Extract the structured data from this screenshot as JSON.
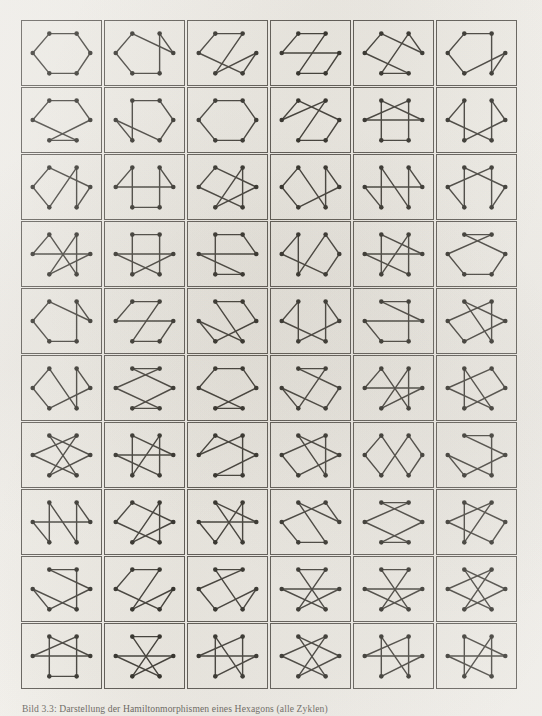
{
  "figure": {
    "caption": "Bild 3.3: Darstellung der Hamiltonmorphismen eines Hexagons (alle Zyklen)",
    "rows": 10,
    "columns": 6,
    "cell_count": 60,
    "vertices_per_cell": 6,
    "edges_per_cell": 6,
    "colors": {
      "page_background": "#f2f0eb",
      "cell_background": "#efede7",
      "cell_border": "#4a4742",
      "edge": "#2a2823",
      "vertex": "#181712"
    }
  },
  "chart_data": {
    "type": "diagram-grid",
    "title": "Bild 3.3: Darstellung der Hamiltonmorphismen eines Hexagons (alle Zyklen)",
    "node_layout": "hexagon",
    "node_positions": [
      {
        "id": 0,
        "label": "top-left",
        "x": 28,
        "y": 13
      },
      {
        "id": 1,
        "label": "top-right",
        "x": 56,
        "y": 13
      },
      {
        "id": 2,
        "label": "middle-right",
        "x": 70,
        "y": 33
      },
      {
        "id": 3,
        "label": "bottom-right",
        "x": 56,
        "y": 54
      },
      {
        "id": 4,
        "label": "bottom-left",
        "x": 28,
        "y": 54
      },
      {
        "id": 5,
        "label": "middle-left",
        "x": 11,
        "y": 33
      }
    ],
    "cells": [
      {
        "index": 1,
        "row": 1,
        "col": 1,
        "cycle": [
          0,
          1,
          2,
          3,
          4,
          5
        ]
      },
      {
        "index": 2,
        "row": 1,
        "col": 2,
        "cycle": [
          0,
          2,
          1,
          3,
          4,
          5
        ]
      },
      {
        "index": 3,
        "row": 1,
        "col": 3,
        "cycle": [
          0,
          1,
          4,
          2,
          3,
          5
        ]
      },
      {
        "index": 4,
        "row": 1,
        "col": 4,
        "cycle": [
          0,
          1,
          4,
          3,
          2,
          5
        ]
      },
      {
        "index": 5,
        "row": 1,
        "col": 5,
        "cycle": [
          0,
          2,
          1,
          4,
          3,
          5
        ]
      },
      {
        "index": 6,
        "row": 1,
        "col": 6,
        "cycle": [
          0,
          1,
          3,
          2,
          4,
          5
        ]
      },
      {
        "index": 7,
        "row": 2,
        "col": 1,
        "cycle": [
          0,
          1,
          2,
          4,
          3,
          5
        ]
      },
      {
        "index": 8,
        "row": 2,
        "col": 2,
        "cycle": [
          0,
          1,
          2,
          3,
          5,
          4
        ]
      },
      {
        "index": 9,
        "row": 2,
        "col": 3,
        "cycle": [
          0,
          1,
          2,
          3,
          4,
          5
        ]
      },
      {
        "index": 10,
        "row": 2,
        "col": 4,
        "cycle": [
          0,
          2,
          3,
          4,
          1,
          5
        ]
      },
      {
        "index": 11,
        "row": 2,
        "col": 5,
        "cycle": [
          0,
          2,
          5,
          1,
          3,
          4
        ]
      },
      {
        "index": 12,
        "row": 2,
        "col": 6,
        "cycle": [
          0,
          4,
          2,
          1,
          3,
          5
        ]
      },
      {
        "index": 13,
        "row": 3,
        "col": 1,
        "cycle": [
          0,
          5,
          4,
          1,
          3,
          2
        ]
      },
      {
        "index": 14,
        "row": 3,
        "col": 2,
        "cycle": [
          0,
          5,
          2,
          1,
          3,
          4
        ]
      },
      {
        "index": 15,
        "row": 3,
        "col": 3,
        "cycle": [
          0,
          2,
          4,
          1,
          3,
          5
        ]
      },
      {
        "index": 16,
        "row": 3,
        "col": 4,
        "cycle": [
          0,
          3,
          1,
          2,
          4,
          5
        ]
      },
      {
        "index": 17,
        "row": 3,
        "col": 5,
        "cycle": [
          0,
          4,
          5,
          2,
          1,
          3
        ]
      },
      {
        "index": 18,
        "row": 3,
        "col": 6,
        "cycle": [
          0,
          2,
          3,
          1,
          5,
          4
        ]
      },
      {
        "index": 19,
        "row": 4,
        "col": 1,
        "cycle": [
          0,
          3,
          1,
          4,
          2,
          5
        ]
      },
      {
        "index": 20,
        "row": 4,
        "col": 2,
        "cycle": [
          0,
          1,
          3,
          5,
          2,
          4
        ]
      },
      {
        "index": 21,
        "row": 4,
        "col": 3,
        "cycle": [
          0,
          1,
          2,
          5,
          3,
          4
        ]
      },
      {
        "index": 22,
        "row": 4,
        "col": 4,
        "cycle": [
          0,
          4,
          1,
          2,
          3,
          5
        ]
      },
      {
        "index": 23,
        "row": 4,
        "col": 5,
        "cycle": [
          0,
          2,
          5,
          3,
          1,
          4
        ]
      },
      {
        "index": 24,
        "row": 4,
        "col": 6,
        "cycle": [
          0,
          2,
          3,
          4,
          5,
          1
        ]
      },
      {
        "index": 25,
        "row": 5,
        "col": 1,
        "cycle": [
          0,
          5,
          4,
          3,
          1,
          2
        ]
      },
      {
        "index": 26,
        "row": 5,
        "col": 2,
        "cycle": [
          0,
          5,
          2,
          3,
          4,
          1
        ]
      },
      {
        "index": 27,
        "row": 5,
        "col": 3,
        "cycle": [
          0,
          1,
          2,
          4,
          5,
          3
        ]
      },
      {
        "index": 28,
        "row": 5,
        "col": 4,
        "cycle": [
          0,
          5,
          3,
          1,
          2,
          4
        ]
      },
      {
        "index": 29,
        "row": 5,
        "col": 5,
        "cycle": [
          0,
          2,
          5,
          4,
          3,
          1
        ]
      },
      {
        "index": 30,
        "row": 5,
        "col": 6,
        "cycle": [
          0,
          3,
          1,
          5,
          4,
          2
        ]
      },
      {
        "index": 31,
        "row": 6,
        "col": 1,
        "cycle": [
          0,
          5,
          4,
          2,
          1,
          3
        ]
      },
      {
        "index": 32,
        "row": 6,
        "col": 2,
        "cycle": [
          0,
          1,
          5,
          3,
          4,
          2
        ]
      },
      {
        "index": 33,
        "row": 6,
        "col": 3,
        "cycle": [
          0,
          5,
          3,
          4,
          2,
          1
        ]
      },
      {
        "index": 34,
        "row": 6,
        "col": 4,
        "cycle": [
          0,
          1,
          4,
          5,
          3,
          2
        ]
      },
      {
        "index": 35,
        "row": 6,
        "col": 5,
        "cycle": [
          0,
          5,
          2,
          4,
          1,
          3
        ]
      },
      {
        "index": 36,
        "row": 6,
        "col": 6,
        "cycle": [
          0,
          3,
          5,
          1,
          2,
          4
        ]
      },
      {
        "index": 37,
        "row": 7,
        "col": 1,
        "cycle": [
          0,
          2,
          4,
          1,
          5,
          3
        ]
      },
      {
        "index": 38,
        "row": 7,
        "col": 2,
        "cycle": [
          0,
          4,
          1,
          3,
          5,
          2
        ]
      },
      {
        "index": 39,
        "row": 7,
        "col": 3,
        "cycle": [
          0,
          2,
          4,
          3,
          1,
          5
        ]
      },
      {
        "index": 40,
        "row": 7,
        "col": 4,
        "cycle": [
          0,
          2,
          4,
          5,
          1,
          3
        ]
      },
      {
        "index": 41,
        "row": 7,
        "col": 5,
        "cycle": [
          0,
          3,
          2,
          1,
          4,
          5
        ]
      },
      {
        "index": 42,
        "row": 7,
        "col": 6,
        "cycle": [
          0,
          1,
          3,
          5,
          4,
          2
        ]
      },
      {
        "index": 43,
        "row": 8,
        "col": 1,
        "cycle": [
          0,
          3,
          1,
          2,
          5,
          4
        ]
      },
      {
        "index": 44,
        "row": 8,
        "col": 2,
        "cycle": [
          0,
          2,
          4,
          1,
          3,
          5
        ]
      },
      {
        "index": 45,
        "row": 8,
        "col": 3,
        "cycle": [
          0,
          2,
          5,
          4,
          1,
          3
        ]
      },
      {
        "index": 46,
        "row": 8,
        "col": 4,
        "cycle": [
          0,
          2,
          1,
          5,
          4,
          3
        ]
      },
      {
        "index": 47,
        "row": 8,
        "col": 5,
        "cycle": [
          0,
          2,
          4,
          3,
          5,
          1
        ]
      },
      {
        "index": 48,
        "row": 8,
        "col": 6,
        "cycle": [
          0,
          2,
          3,
          5,
          1,
          4
        ]
      },
      {
        "index": 49,
        "row": 9,
        "col": 1,
        "cycle": [
          0,
          2,
          4,
          5,
          3,
          1
        ]
      },
      {
        "index": 50,
        "row": 9,
        "col": 2,
        "cycle": [
          0,
          5,
          3,
          2,
          4,
          1
        ]
      },
      {
        "index": 51,
        "row": 9,
        "col": 3,
        "cycle": [
          0,
          1,
          5,
          4,
          2,
          3
        ]
      },
      {
        "index": 52,
        "row": 9,
        "col": 4,
        "cycle": [
          0,
          1,
          4,
          2,
          5,
          3
        ]
      },
      {
        "index": 53,
        "row": 9,
        "col": 5,
        "cycle": [
          0,
          3,
          5,
          2,
          4,
          1
        ]
      },
      {
        "index": 54,
        "row": 9,
        "col": 6,
        "cycle": [
          0,
          2,
          4,
          1,
          5,
          3
        ]
      },
      {
        "index": 55,
        "row": 10,
        "col": 1,
        "cycle": [
          0,
          2,
          5,
          1,
          3,
          4
        ]
      },
      {
        "index": 56,
        "row": 10,
        "col": 2,
        "cycle": [
          0,
          3,
          5,
          2,
          4,
          1
        ]
      },
      {
        "index": 57,
        "row": 10,
        "col": 3,
        "cycle": [
          0,
          3,
          1,
          5,
          2,
          4
        ]
      },
      {
        "index": 58,
        "row": 10,
        "col": 4,
        "cycle": [
          0,
          3,
          5,
          1,
          4,
          2
        ]
      },
      {
        "index": 59,
        "row": 10,
        "col": 5,
        "cycle": [
          0,
          4,
          2,
          5,
          1,
          3
        ]
      },
      {
        "index": 60,
        "row": 10,
        "col": 6,
        "cycle": [
          0,
          4,
          1,
          3,
          5,
          2
        ]
      }
    ]
  }
}
